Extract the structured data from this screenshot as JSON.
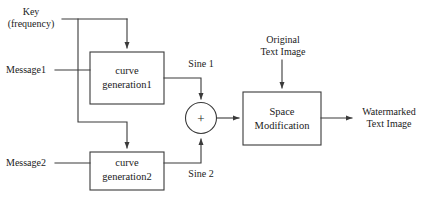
{
  "diagram": {
    "stroke_color": "#3a3a3a",
    "text_color": "#1a1a1a",
    "background": "#ffffff",
    "inputs": {
      "key": "Key\n(frequency)",
      "key_line1": "Key",
      "key_line2": "(frequency)",
      "message1": "Message1",
      "message2": "Message2",
      "original_image_line1": "Original",
      "original_image_line2": "Text Image"
    },
    "blocks": [
      {
        "id": "curve-generation-1",
        "line1": "curve",
        "line2": "generation1"
      },
      {
        "id": "curve-generation-2",
        "line1": "curve",
        "line2": "generation2"
      },
      {
        "id": "space-modification",
        "line1": "Space",
        "line2": "Modification"
      }
    ],
    "adder": {
      "id": "summing-junction",
      "symbol": "+"
    },
    "signals": {
      "sine1": "Sine 1",
      "sine2": "Sine 2"
    },
    "outputs": {
      "watermarked_line1": "Watermarked",
      "watermarked_line2": "Text Image"
    }
  }
}
